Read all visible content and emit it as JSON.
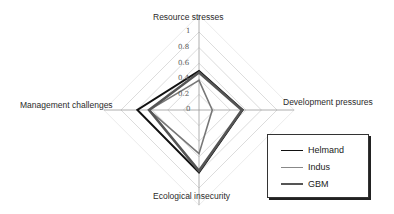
{
  "chart_data": {
    "type": "radar",
    "title": "",
    "axes": [
      "Resource stresses",
      "Development pressures",
      "Ecological insecurity",
      "Management challenges"
    ],
    "range": [
      0,
      1
    ],
    "ticks": [
      "0",
      "0.2",
      "0.4",
      "0.6",
      "0.8",
      "1"
    ],
    "grid": true,
    "legend_position": "lower-right",
    "series": [
      {
        "name": "Helmand",
        "values": [
          0.5,
          0.56,
          0.8,
          0.79
        ],
        "color": "#111111",
        "width": 2
      },
      {
        "name": "Indus",
        "values": [
          0.38,
          0.17,
          0.56,
          0.64
        ],
        "color": "#777777",
        "width": 1.6
      },
      {
        "name": "GBM",
        "values": [
          0.48,
          0.55,
          0.78,
          0.64
        ],
        "color": "#555555",
        "width": 2.6
      }
    ]
  },
  "labels": {
    "top": "Resource stresses",
    "right": "Development pressures",
    "bottom": "Ecological insecurity",
    "left": "Management challenges"
  },
  "ticks": {
    "t0": "0",
    "t1": "0.2",
    "t2": "0.4",
    "t3": "0.6",
    "t4": "0.8",
    "t5": "1"
  },
  "legend": {
    "helmand": "Helmand",
    "indus": "Indus",
    "gbm": "GBM"
  }
}
